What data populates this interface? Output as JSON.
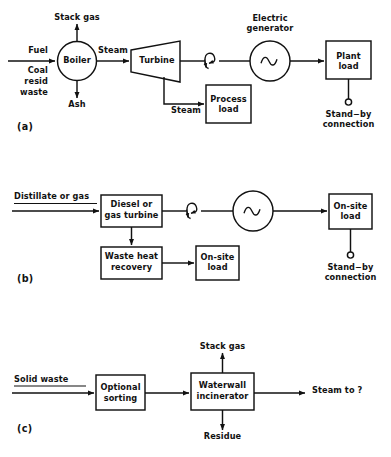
{
  "figure": {
    "background_color": "#ffffff",
    "line_color": "#111111",
    "panels": [
      {
        "tag": "(a)",
        "name": "steam-turbine-cogeneration",
        "inputs": [
          {
            "name": "fuel-input-label",
            "text": "Fuel"
          },
          {
            "name": "fuel-detail-line-1",
            "text": "Coal"
          },
          {
            "name": "fuel-detail-line-2",
            "text": "resid"
          },
          {
            "name": "fuel-detail-line-3",
            "text": "waste"
          }
        ],
        "nodes": [
          {
            "name": "boiler",
            "shape": "circle",
            "text": "Boiler"
          },
          {
            "name": "turbine",
            "shape": "trapezoid",
            "text": "Turbine"
          },
          {
            "name": "electric-generator",
            "shape": "circle",
            "symbol": "sine-wave",
            "caption_line_1": "Electric",
            "caption_line_2": "generator"
          },
          {
            "name": "plant-load",
            "shape": "box",
            "text_line_1": "Plant",
            "text_line_2": "load"
          },
          {
            "name": "process-load",
            "shape": "box",
            "text_line_1": "Process",
            "text_line_2": "load"
          }
        ],
        "flow_labels": [
          {
            "name": "stack-gas-label",
            "text": "Stack gas"
          },
          {
            "name": "ash-label",
            "text": "Ash"
          },
          {
            "name": "steam-to-turbine-label",
            "text": "Steam"
          },
          {
            "name": "steam-to-process-label",
            "text": "Steam"
          }
        ],
        "standby": {
          "name": "stand-by-connection",
          "line_1": "Stand−by",
          "line_2": "connection"
        }
      },
      {
        "tag": "(b)",
        "name": "gas-turbine-cogeneration",
        "inputs": [
          {
            "name": "distillate-or-gas-label",
            "text": "Distillate or gas"
          }
        ],
        "nodes": [
          {
            "name": "diesel-or-gas-turbine",
            "shape": "box",
            "text_line_1": "Diesel or",
            "text_line_2": "gas turbine"
          },
          {
            "name": "waste-heat-recovery",
            "shape": "box",
            "text_line_1": "Waste heat",
            "text_line_2": "recovery"
          },
          {
            "name": "on-site-load-thermal",
            "shape": "box",
            "text_line_1": "On-site",
            "text_line_2": "load"
          },
          {
            "name": "electric-generator",
            "shape": "circle",
            "symbol": "sine-wave"
          },
          {
            "name": "on-site-load-electric",
            "shape": "box",
            "text_line_1": "On-site",
            "text_line_2": "load"
          }
        ],
        "standby": {
          "name": "stand-by-connection",
          "line_1": "Stand−by",
          "line_2": "connection"
        }
      },
      {
        "tag": "(c)",
        "name": "waterwall-incinerator-system",
        "inputs": [
          {
            "name": "solid-waste-label",
            "text": "Solid waste"
          }
        ],
        "nodes": [
          {
            "name": "optional-sorting",
            "shape": "box",
            "text_line_1": "Optional",
            "text_line_2": "sorting"
          },
          {
            "name": "waterwall-incinerator",
            "shape": "box",
            "text_line_1": "Waterwall",
            "text_line_2": "incinerator"
          }
        ],
        "flow_labels": [
          {
            "name": "stack-gas-label",
            "text": "Stack gas"
          },
          {
            "name": "residue-label",
            "text": "Residue"
          },
          {
            "name": "steam-output-label",
            "text": "Steam to ?"
          }
        ]
      }
    ]
  }
}
